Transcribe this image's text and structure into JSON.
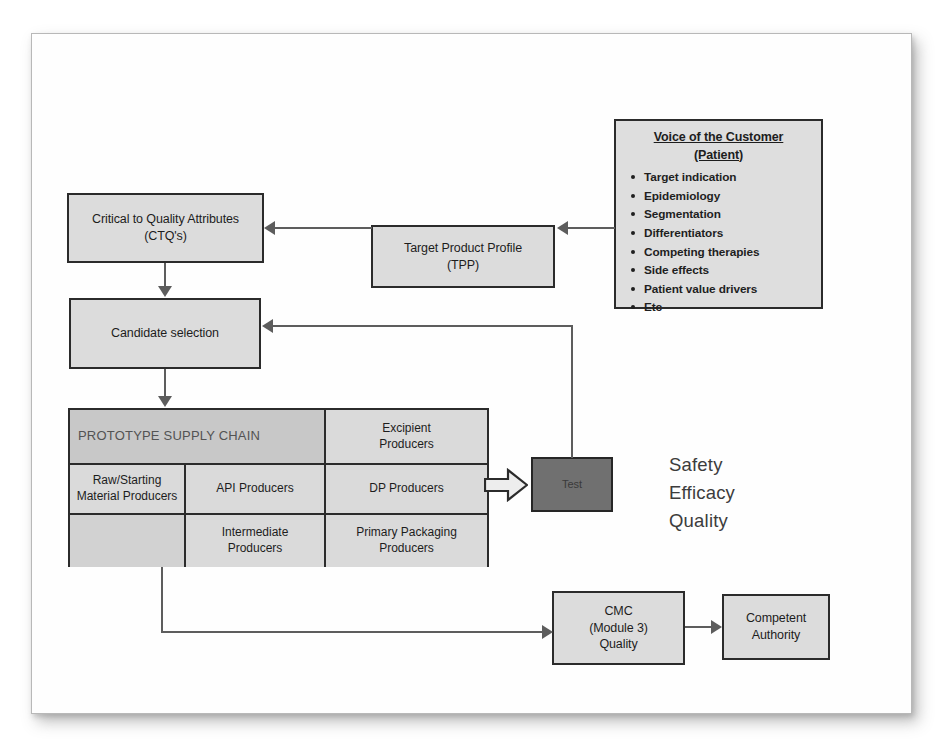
{
  "diagram": {
    "colors": {
      "box_fill": "#dcdcdc",
      "box_border": "#2b2b2b",
      "test_fill": "#707070",
      "header_fill": "#c8c8c8",
      "connector": "#5d5d5d",
      "page_background": "#fefefe"
    },
    "nodes": {
      "ctq": {
        "line1": "Critical to Quality Attributes",
        "line2": "(CTQ's)"
      },
      "candidate_selection": {
        "label": "Candidate selection"
      },
      "tpp": {
        "line1": "Target Product Profile",
        "line2": "(TPP)"
      },
      "voice_of_customer": {
        "title_line1": "Voice of the Customer",
        "title_line2": "(Patient)",
        "items": [
          "Target indication",
          "Epidemiology",
          "Segmentation",
          "Differentiators",
          "Competing therapies",
          "Side effects",
          "Patient value drivers",
          "Etc"
        ]
      },
      "test": {
        "label": "Test"
      },
      "cmc": {
        "line1": "CMC",
        "line2": "(Module 3)",
        "line3": "Quality"
      },
      "competent_authority": {
        "line1": "Competent",
        "line2": "Authority"
      }
    },
    "supply_chain_table": {
      "header": "PROTOTYPE SUPPLY CHAIN",
      "rows": [
        {
          "cells": [
            "PROTOTYPE SUPPLY CHAIN",
            "",
            "Excipient Producers"
          ]
        },
        {
          "cells": [
            "Raw/Starting Material Producers",
            "API Producers",
            "DP Producers"
          ]
        },
        {
          "cells": [
            "",
            "Intermediate Producers",
            "Primary Packaging Producers"
          ]
        }
      ],
      "cell_excipient_line1": "Excipient",
      "cell_excipient_line2": "Producers",
      "cell_raw_line1": "Raw/Starting",
      "cell_raw_line2": "Material Producers",
      "cell_api": "API Producers",
      "cell_dp": "DP Producers",
      "cell_intermediate_line1": "Intermediate",
      "cell_intermediate_line2": "Producers",
      "cell_packaging_line1": "Primary Packaging",
      "cell_packaging_line2": "Producers",
      "cell_blank": ""
    },
    "outcomes": {
      "items": [
        "Safety",
        "Efficacy",
        "Quality"
      ]
    },
    "connectors": [
      {
        "name": "voc-to-tpp",
        "from": "Voice of the Customer",
        "to": "Target Product Profile",
        "style": "arrow-left"
      },
      {
        "name": "tpp-to-ctq",
        "from": "Target Product Profile",
        "to": "Critical to Quality Attributes",
        "style": "arrow-left"
      },
      {
        "name": "ctq-to-candidate",
        "from": "Critical to Quality Attributes",
        "to": "Candidate selection",
        "style": "arrow-down"
      },
      {
        "name": "candidate-to-supplychain",
        "from": "Candidate selection",
        "to": "PROTOTYPE SUPPLY CHAIN",
        "style": "arrow-down"
      },
      {
        "name": "dp-to-test",
        "from": "DP Producers",
        "to": "Test",
        "style": "block-arrow-right"
      },
      {
        "name": "test-to-candidate-feedback",
        "from": "Test",
        "to": "Candidate selection",
        "style": "arrow-left"
      },
      {
        "name": "supplychain-to-cmc",
        "from": "PROTOTYPE SUPPLY CHAIN",
        "to": "CMC (Module 3) Quality",
        "style": "arrow-right"
      },
      {
        "name": "cmc-to-authority",
        "from": "CMC (Module 3) Quality",
        "to": "Competent Authority",
        "style": "arrow-right"
      }
    ]
  }
}
